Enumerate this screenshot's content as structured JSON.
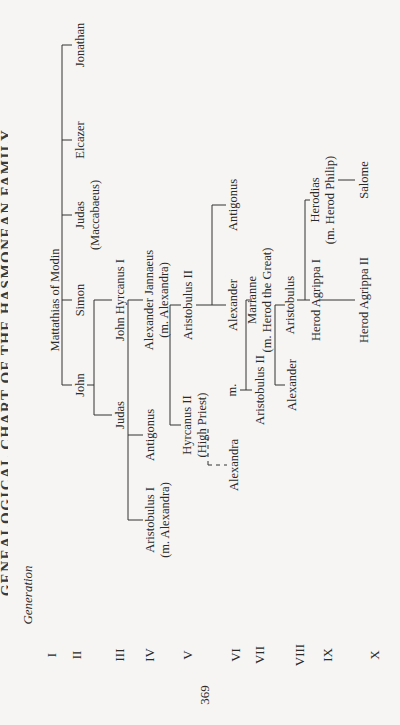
{
  "header": {
    "title": "GENEALOGICAL CHART OF THE HASMONEAN FAMILY"
  },
  "generation_label": "Generation",
  "generations": [
    "I",
    "II",
    "III",
    "IV",
    "V",
    "VI",
    "VII",
    "VIII",
    "IX",
    "X"
  ],
  "page_number": "369",
  "nodes": {
    "mattathias": {
      "name": "Mattathias of Modin"
    },
    "john": {
      "name": "John"
    },
    "simon": {
      "name": "Simon"
    },
    "judas_maccabaeus": {
      "name": "Judas",
      "note": "(Maccabaeus)"
    },
    "elcazer": {
      "name": "Elcazer"
    },
    "jonathan": {
      "name": "Jonathan"
    },
    "judas": {
      "name": "Judas"
    },
    "john_hyrcanus_i": {
      "name": "John Hyrcanus I"
    },
    "antigonus_iv": {
      "name": "Antigonus"
    },
    "alexander_jannaeus": {
      "name": "Alexander Jannaeus",
      "note": "(m. Alexandra)"
    },
    "aristobulus_i": {
      "name": "Aristobulus I",
      "note": "(m. Alexandra)"
    },
    "hyrcanus_ii": {
      "name": "Hyrcanus II",
      "note": "(High Priest)"
    },
    "aristobulus_ii_v": {
      "name": "Aristobulus II"
    },
    "alexandra": {
      "name": "Alexandra"
    },
    "married": {
      "name": "m."
    },
    "alexander_vi": {
      "name": "Alexander"
    },
    "antigonus_vi": {
      "name": "Antigonus"
    },
    "aristobulus_ii_vii": {
      "name": "Aristobulus II"
    },
    "marianne": {
      "name": "Marianne",
      "note": "(m. Herod the Great)"
    },
    "alexander_viii": {
      "name": "Alexander"
    },
    "aristobulus_viii": {
      "name": "Aristobulus"
    },
    "herod_agrippa_i": {
      "name": "Herod Agrippa I"
    },
    "herodias": {
      "name": "Herodias",
      "note": "(m. Herod Philip)"
    },
    "herod_agrippa_ii": {
      "name": "Herod Agrippa II"
    },
    "salome": {
      "name": "Salome"
    }
  }
}
